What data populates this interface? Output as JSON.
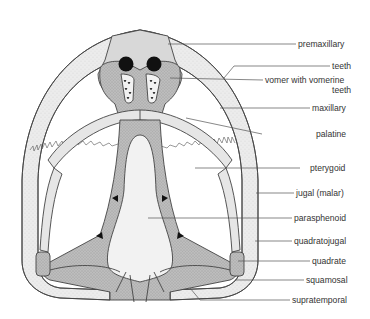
{
  "figure": {
    "labels": [
      {
        "id": "premaxillary",
        "text": "premaxillary"
      },
      {
        "id": "teeth",
        "text": "teeth"
      },
      {
        "id": "vomer",
        "text": "vomer with vomerine",
        "text2": "teeth"
      },
      {
        "id": "maxillary",
        "text": "maxillary"
      },
      {
        "id": "palatine",
        "text": "palatine"
      },
      {
        "id": "pterygoid",
        "text": "pterygoid"
      },
      {
        "id": "jugal",
        "text": "jugal (malar)"
      },
      {
        "id": "parasphenoid",
        "text": "parasphenoid"
      },
      {
        "id": "quadratojugal",
        "text": "quadratojugal"
      },
      {
        "id": "quadrate",
        "text": "quadrate"
      },
      {
        "id": "squamosal",
        "text": "squamosal"
      },
      {
        "id": "supratemporal",
        "text": "supratemporal"
      }
    ],
    "colors": {
      "light_bone": "#ececec",
      "mid_bone": "#c9c9c9",
      "dark_bone": "#aeaeae",
      "parasphenoid": "#efefef",
      "outline": "#444444",
      "nares": "#111111"
    }
  }
}
